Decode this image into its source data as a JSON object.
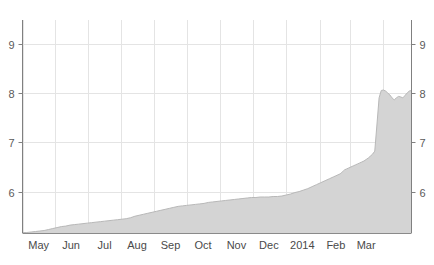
{
  "chart_data": {
    "type": "area",
    "title": "",
    "subtitle": "",
    "xlabel": "",
    "ylabel": "",
    "ylim": [
      5.16,
      9.48
    ],
    "xlim": [
      0,
      360
    ],
    "grid": true,
    "legend": null,
    "y_ticks": [
      6,
      7,
      8,
      9
    ],
    "y_tick_labels": [
      "6",
      "7",
      "8",
      "9"
    ],
    "y_axis_right_labels": [
      "6",
      "7",
      "8",
      "9"
    ],
    "x_tick_labels": [
      "May",
      "Jun",
      "Jul",
      "Aug",
      "Sep",
      "Oct",
      "Nov",
      "Dec",
      "2014",
      "Feb",
      "Mar"
    ],
    "x_tick_positions": [
      15,
      45,
      76,
      106,
      137,
      167,
      198,
      228,
      259,
      290,
      318
    ],
    "x_gridline_positions": [
      0,
      30,
      61,
      91,
      122,
      152,
      183,
      213,
      244,
      275,
      303,
      334
    ],
    "series": [
      {
        "name": "value",
        "fill_color": "#d4d4d4",
        "line_color": "#b8b8b8",
        "x": [
          0,
          4,
          8,
          12,
          16,
          20,
          24,
          28,
          32,
          36,
          40,
          44,
          48,
          52,
          56,
          60,
          64,
          68,
          72,
          76,
          80,
          84,
          88,
          92,
          96,
          100,
          104,
          108,
          112,
          116,
          120,
          124,
          128,
          132,
          136,
          140,
          144,
          148,
          152,
          156,
          160,
          164,
          168,
          172,
          176,
          180,
          184,
          188,
          192,
          196,
          200,
          204,
          208,
          212,
          216,
          220,
          224,
          228,
          232,
          236,
          240,
          244,
          248,
          252,
          256,
          260,
          264,
          268,
          272,
          276,
          280,
          284,
          288,
          290,
          292,
          294,
          295,
          296,
          297,
          298,
          300,
          302,
          304,
          306,
          308,
          310,
          312,
          314,
          316,
          318,
          320,
          322,
          324,
          326,
          328,
          330,
          332,
          334,
          336,
          338,
          340,
          342,
          344,
          346,
          348,
          350,
          352,
          354,
          356,
          358,
          360
        ],
        "y": [
          5.17,
          5.17,
          5.18,
          5.19,
          5.2,
          5.21,
          5.23,
          5.25,
          5.27,
          5.29,
          5.3,
          5.32,
          5.33,
          5.34,
          5.35,
          5.36,
          5.37,
          5.38,
          5.39,
          5.4,
          5.41,
          5.42,
          5.43,
          5.44,
          5.45,
          5.47,
          5.5,
          5.52,
          5.54,
          5.56,
          5.58,
          5.6,
          5.62,
          5.64,
          5.66,
          5.68,
          5.7,
          5.71,
          5.72,
          5.73,
          5.74,
          5.75,
          5.76,
          5.78,
          5.79,
          5.8,
          5.81,
          5.82,
          5.83,
          5.84,
          5.85,
          5.86,
          5.87,
          5.88,
          5.88,
          5.89,
          5.89,
          5.89,
          5.9,
          5.9,
          5.91,
          5.93,
          5.95,
          5.98,
          6.0,
          6.03,
          6.06,
          6.1,
          6.14,
          6.18,
          6.22,
          6.26,
          6.3,
          6.32,
          6.34,
          6.36,
          6.38,
          6.4,
          6.42,
          6.44,
          6.46,
          6.48,
          6.5,
          6.52,
          6.54,
          6.56,
          6.58,
          6.6,
          6.62,
          6.65,
          6.68,
          6.72,
          6.76,
          6.82,
          7.35,
          7.9,
          8.05,
          8.06,
          8.04,
          8.0,
          7.96,
          7.9,
          7.86,
          7.9,
          7.93,
          7.92,
          7.9,
          7.95,
          8.0,
          8.04,
          8.05
        ]
      }
    ]
  },
  "axes": {
    "left_axis_color": "#808080",
    "right_axis_color": "#808080",
    "grid_color": "#e4e4e4",
    "background": "#ffffff"
  }
}
